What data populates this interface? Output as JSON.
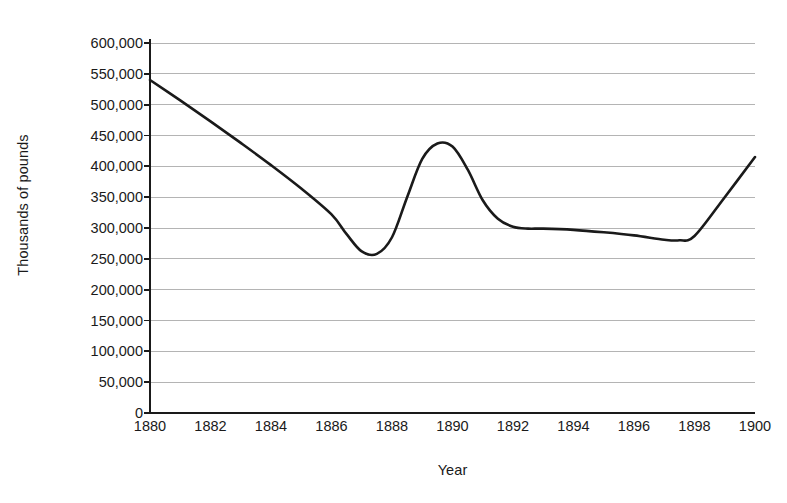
{
  "chart_data": {
    "type": "line",
    "title": "",
    "xlabel": "Year",
    "ylabel": "Thousands of pounds",
    "xlim": [
      1880,
      1900
    ],
    "ylim": [
      0,
      600000
    ],
    "grid": true,
    "legend": null,
    "x_tick_labels": [
      "1880",
      "1882",
      "1884",
      "1886",
      "1888",
      "1890",
      "1892",
      "1894",
      "1896",
      "1898",
      "1900"
    ],
    "x_ticks": [
      1880,
      1882,
      1884,
      1886,
      1888,
      1890,
      1892,
      1894,
      1896,
      1898,
      1900
    ],
    "y_tick_labels": [
      "0",
      "50,000",
      "100,000",
      "150,000",
      "200,000",
      "250,000",
      "300,000",
      "350,000",
      "400,000",
      "450,000",
      "500,000",
      "550,000",
      "600,000"
    ],
    "y_ticks": [
      0,
      50000,
      100000,
      150000,
      200000,
      250000,
      300000,
      350000,
      400000,
      450000,
      500000,
      550000,
      600000
    ],
    "series": [
      {
        "name": "value",
        "color": "#1a1a1a",
        "x": [
          1880,
          1881,
          1882,
          1883,
          1884,
          1885,
          1886,
          1886.5,
          1887,
          1887.5,
          1888,
          1888.5,
          1889,
          1889.5,
          1890,
          1890.5,
          1891,
          1891.5,
          1892,
          1892.5,
          1893,
          1894,
          1895,
          1896,
          1897,
          1897.5,
          1898,
          1899,
          1900
        ],
        "values": [
          540000,
          507000,
          473000,
          438000,
          402000,
          364000,
          322000,
          290000,
          262000,
          258000,
          285000,
          350000,
          412000,
          437000,
          432000,
          395000,
          345000,
          315000,
          302000,
          299000,
          299000,
          297000,
          293000,
          288000,
          281000,
          280000,
          287000,
          350000,
          415000
        ]
      }
    ]
  },
  "axes": {
    "y_axis_title": "Thousands of pounds",
    "x_axis_title": "Year"
  },
  "colors": {
    "line": "#1a1a1a",
    "grid": "#b4b4b4",
    "axis": "#1a1a1a",
    "background": "#ffffff"
  }
}
